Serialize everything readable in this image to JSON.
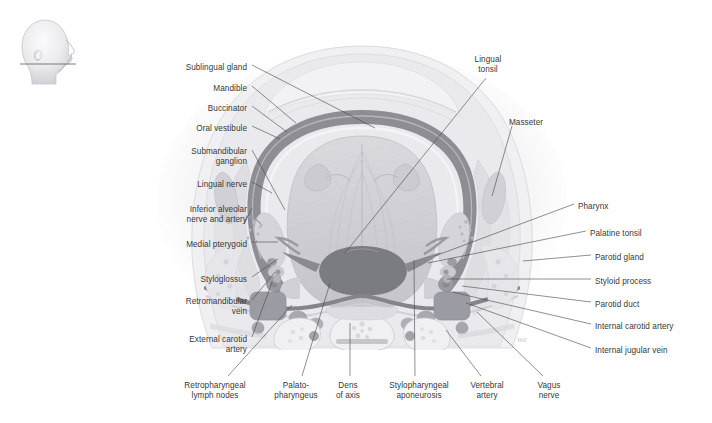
{
  "figure": {
    "orientation_icon": "head-profile-section-icon",
    "watermark": "Voll"
  },
  "labels_left": [
    {
      "id": "sublingual-gland",
      "text": "Sublingual gland",
      "lines": [
        "Sublingual gland"
      ],
      "x": 247,
      "y": 63,
      "lead": [
        [
          252,
          65
        ],
        [
          375,
          128
        ]
      ]
    },
    {
      "id": "mandible",
      "text": "Mandible",
      "lines": [
        "Mandible"
      ],
      "x": 247,
      "y": 84,
      "lead": [
        [
          252,
          86
        ],
        [
          296,
          123
        ]
      ]
    },
    {
      "id": "buccinator",
      "text": "Buccinator",
      "lines": [
        "Buccinator"
      ],
      "x": 247,
      "y": 104,
      "lead": [
        [
          252,
          106
        ],
        [
          287,
          132
        ]
      ]
    },
    {
      "id": "oral-vestibule",
      "text": "Oral vestibule",
      "lines": [
        "Oral vestibule"
      ],
      "x": 247,
      "y": 124,
      "lead": [
        [
          252,
          126
        ],
        [
          280,
          139
        ]
      ]
    },
    {
      "id": "submandibular-ganglion",
      "text": "Submandibular ganglion",
      "lines": [
        "Submandibular",
        "ganglion"
      ],
      "x": 247,
      "y": 147,
      "lead": [
        [
          252,
          150
        ],
        [
          285,
          210
        ]
      ]
    },
    {
      "id": "lingual-nerve",
      "text": "Lingual nerve",
      "lines": [
        "Lingual nerve"
      ],
      "x": 247,
      "y": 180,
      "lead": [
        [
          252,
          182
        ],
        [
          272,
          193
        ]
      ]
    },
    {
      "id": "inferior-alveolar-nerve-artery",
      "text": "Inferior alveolar nerve and artery",
      "lines": [
        "Inferior alveolar",
        "nerve and artery"
      ],
      "x": 247,
      "y": 205,
      "lead": [
        [
          252,
          208
        ],
        [
          244,
          224
        ]
      ]
    },
    {
      "id": "medial-pterygoid",
      "text": "Medial pterygoid",
      "lines": [
        "Medial pterygoid"
      ],
      "x": 247,
      "y": 240,
      "lead": [
        [
          252,
          242
        ],
        [
          278,
          242
        ]
      ]
    },
    {
      "id": "styloglossus",
      "text": "Styloglossus",
      "lines": [
        "Styloglossus"
      ],
      "x": 247,
      "y": 275,
      "lead": [
        [
          252,
          277
        ],
        [
          278,
          259
        ]
      ]
    },
    {
      "id": "retromandibular-vein",
      "text": "Retromandibular vein",
      "lines": [
        "Retromandibular",
        "vein"
      ],
      "x": 247,
      "y": 297,
      "lead": [
        [
          252,
          300
        ],
        [
          275,
          272
        ]
      ]
    },
    {
      "id": "external-carotid-artery",
      "text": "External carotid artery",
      "lines": [
        "External carotid",
        "artery"
      ],
      "x": 247,
      "y": 335,
      "lead": [
        [
          252,
          337
        ],
        [
          272,
          282
        ]
      ]
    }
  ],
  "labels_right": [
    {
      "id": "lingual-tonsil",
      "text": "Lingual tonsil",
      "lines": [
        "Lingual",
        "tonsil"
      ],
      "x": 488,
      "y": 55,
      "align": "center",
      "lead": [
        [
          486,
          78
        ],
        [
          345,
          253
        ]
      ]
    },
    {
      "id": "masseter",
      "text": "Masseter",
      "lines": [
        "Masseter"
      ],
      "x": 509,
      "y": 118,
      "align": "left",
      "lead": [
        [
          512,
          126
        ],
        [
          492,
          196
        ]
      ]
    },
    {
      "id": "pharynx",
      "text": "Pharynx",
      "lines": [
        "Pharynx"
      ],
      "x": 578,
      "y": 202,
      "align": "left",
      "lead": [
        [
          574,
          204
        ],
        [
          435,
          256
        ]
      ]
    },
    {
      "id": "palatine-tonsil",
      "text": "Palatine tonsil",
      "lines": [
        "Palatine tonsil"
      ],
      "x": 590,
      "y": 229,
      "align": "left",
      "lead": [
        [
          586,
          231
        ],
        [
          428,
          263
        ]
      ]
    },
    {
      "id": "parotid-gland",
      "text": "Parotid gland",
      "lines": [
        "Parotid gland"
      ],
      "x": 595,
      "y": 253,
      "align": "left",
      "lead": [
        [
          591,
          255
        ],
        [
          523,
          261
        ]
      ]
    },
    {
      "id": "styloid-process",
      "text": "Styloid process",
      "lines": [
        "Styloid process"
      ],
      "x": 595,
      "y": 277,
      "align": "left",
      "lead": [
        [
          591,
          279
        ],
        [
          447,
          279
        ]
      ]
    },
    {
      "id": "parotid-duct",
      "text": "Parotid duct",
      "lines": [
        "Parotid duct"
      ],
      "x": 595,
      "y": 300,
      "align": "left",
      "lead": [
        [
          591,
          302
        ],
        [
          462,
          286
        ]
      ]
    },
    {
      "id": "internal-carotid-artery",
      "text": "Internal carotid artery",
      "lines": [
        "Internal carotid artery"
      ],
      "x": 595,
      "y": 322,
      "align": "left",
      "lead": [
        [
          591,
          324
        ],
        [
          452,
          292
        ]
      ]
    },
    {
      "id": "internal-jugular-vein",
      "text": "Internal jugular vein",
      "lines": [
        "Internal jugular vein"
      ],
      "x": 595,
      "y": 346,
      "align": "left",
      "lead": [
        [
          591,
          348
        ],
        [
          466,
          303
        ]
      ]
    }
  ],
  "labels_bottom": [
    {
      "id": "retropharyngeal-lymph-nodes",
      "text": "Retropharyngeal lymph nodes",
      "lines": [
        "Retropharyngeal",
        "lymph nodes"
      ],
      "x": 215,
      "y": 381,
      "lead": [
        [
          228,
          376
        ],
        [
          292,
          305
        ]
      ]
    },
    {
      "id": "palatopharyngeus",
      "text": "Palatopharyngeus",
      "lines": [
        "Palato-",
        "pharyngeus"
      ],
      "x": 296,
      "y": 381,
      "lead": [
        [
          302,
          376
        ],
        [
          330,
          283
        ]
      ]
    },
    {
      "id": "dens-of-axis",
      "text": "Dens of axis",
      "lines": [
        "Dens",
        "of axis"
      ],
      "x": 348,
      "y": 381,
      "lead": [
        [
          350,
          376
        ],
        [
          350,
          323
        ]
      ]
    },
    {
      "id": "stylopharyngeal-aponeurosis",
      "text": "Stylopharyngeal aponeurosis",
      "lines": [
        "Stylopharyngeal",
        "aponeurosis"
      ],
      "x": 419,
      "y": 381,
      "lead": [
        [
          415,
          376
        ],
        [
          414,
          260
        ]
      ]
    },
    {
      "id": "vertebral-artery",
      "text": "Vertebral artery",
      "lines": [
        "Vertebral",
        "artery"
      ],
      "x": 487,
      "y": 381,
      "lead": [
        [
          481,
          376
        ],
        [
          446,
          330
        ]
      ]
    },
    {
      "id": "vagus-nerve",
      "text": "Vagus nerve",
      "lines": [
        "Vagus",
        "nerve"
      ],
      "x": 549,
      "y": 381,
      "lead": [
        [
          543,
          376
        ],
        [
          477,
          312
        ]
      ]
    }
  ],
  "colors": {
    "background": "#ffffff",
    "label_text": "#38383a",
    "leader_line": "#4a4a4c",
    "bone_dark": "#8e8e93",
    "muscle_mid": "#c8c8cc",
    "tissue_light": "#e4e4e7",
    "vessel_dark": "#a0a0a6"
  }
}
